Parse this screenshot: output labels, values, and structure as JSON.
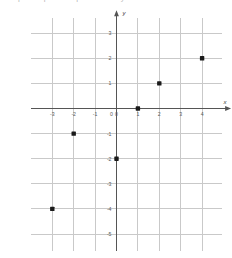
{
  "caption": {
    "text": "Graph the points represented by the table below."
  },
  "chart_data": {
    "type": "scatter",
    "title": "",
    "xlabel": "x",
    "ylabel": "y",
    "xlim": [
      -3.8,
      4.8
    ],
    "ylim": [
      -5.6,
      3.6
    ],
    "grid": true,
    "legend": false,
    "x_ticks": [
      -3,
      -2,
      -1,
      0,
      1,
      2,
      3,
      4
    ],
    "x_tick_labels": [
      "-3",
      "-2",
      "-1",
      "0",
      "1",
      "2",
      "3",
      "4"
    ],
    "y_ticks": [
      3,
      2,
      1,
      0,
      -1,
      -2,
      -3,
      -4,
      -5
    ],
    "y_tick_labels": [
      "3",
      "2",
      "1",
      "0",
      "-1",
      "-2",
      "-3",
      "-4",
      "-5"
    ],
    "origin_label": "0",
    "point_color": "#1a1a1a",
    "grid_color": "#c9c9c9",
    "axis_color": "#555555",
    "points": [
      {
        "x": -3,
        "y": -4
      },
      {
        "x": -2,
        "y": -1
      },
      {
        "x": 0,
        "y": -2
      },
      {
        "x": 1,
        "y": 0
      },
      {
        "x": 2,
        "y": 1
      },
      {
        "x": 4,
        "y": 2
      }
    ]
  }
}
